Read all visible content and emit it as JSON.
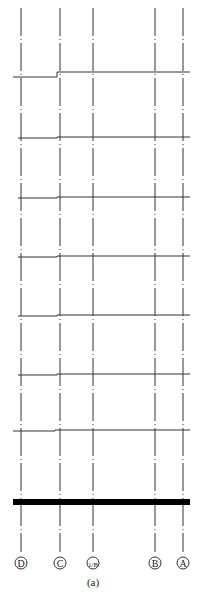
{
  "diagram": {
    "type": "structural-frame-elevation",
    "caption": "(a)",
    "colors": {
      "line": "#333333",
      "base": "#000000",
      "background": "#ffffff"
    },
    "axes": [
      {
        "label": "D",
        "x": 21
      },
      {
        "label": "C",
        "x": 60
      },
      {
        "label": "1/B",
        "x": 93
      },
      {
        "label": "B",
        "x": 155
      },
      {
        "label": "A",
        "x": 183
      }
    ],
    "floors": [
      {
        "y_left": 77,
        "y_right": 72,
        "step_x": 57,
        "x_start": 13
      },
      {
        "y_left": 138,
        "y_right": 137,
        "step_x": 57,
        "x_start": 18
      },
      {
        "y_left": 198,
        "y_right": 197,
        "step_x": 57,
        "x_start": 18
      },
      {
        "y_left": 257,
        "y_right": 256,
        "step_x": 57,
        "x_start": 18
      },
      {
        "y_left": 316,
        "y_right": 315,
        "step_x": 57,
        "x_start": 18
      },
      {
        "y_left": 375,
        "y_right": 374,
        "step_x": 57,
        "x_start": 18
      },
      {
        "y_left": 431,
        "y_right": 430,
        "step_x": 55,
        "x_start": 13
      }
    ],
    "base": {
      "y": 502,
      "x_start": 13,
      "x_end": 190,
      "thickness": 6
    }
  }
}
